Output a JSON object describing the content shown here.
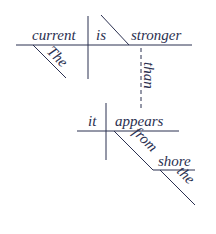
{
  "diagram": {
    "type": "sentence-diagram",
    "sentence": "The current is stronger than it appears from the shore",
    "colors": {
      "ink": "#2b3050",
      "background": "#ffffff"
    },
    "main_clause": {
      "subject": "current",
      "verb": "is",
      "predicate_complement": "stronger",
      "subject_modifier": "The"
    },
    "connector": "than",
    "sub_clause": {
      "subject": "it",
      "verb": "appears",
      "preposition": "from",
      "object": "shore",
      "object_modifier": "the"
    }
  }
}
